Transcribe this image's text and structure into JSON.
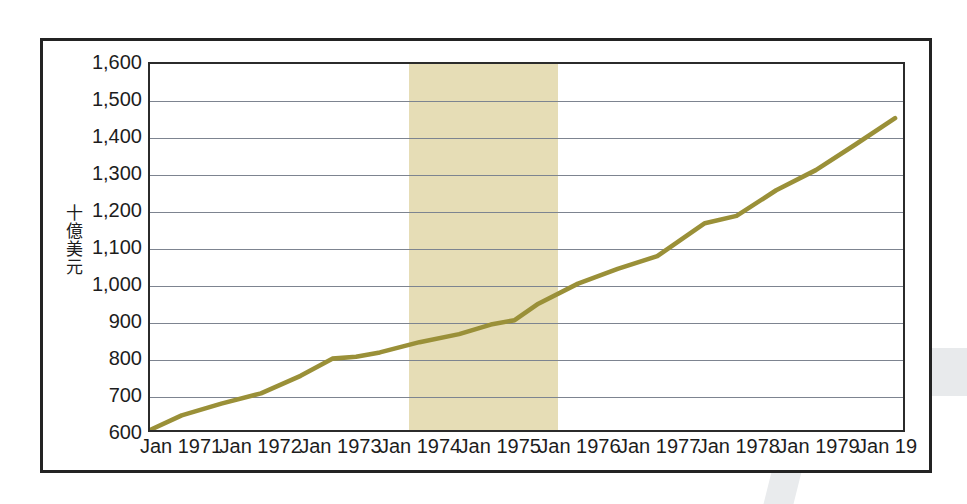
{
  "chart_data": {
    "type": "line",
    "title": "",
    "subtitle": "",
    "xlabel": "",
    "ylabel": "十億美元",
    "ylabel_chars": [
      "十",
      "億",
      "美",
      "元"
    ],
    "ylim": [
      600,
      1600
    ],
    "ytick_step": 100,
    "ytick_labels": [
      "1,600",
      "1,500",
      "1,400",
      "1,300",
      "1,200",
      "1,100",
      "1,000",
      "900",
      "800",
      "700",
      "600"
    ],
    "ytick_values": [
      1600,
      1500,
      1400,
      1300,
      1200,
      1100,
      1000,
      900,
      800,
      700,
      600
    ],
    "xtick_labels": [
      "Jan 1971",
      "Jan 1972",
      "Jan 1973",
      "Jan 1974",
      "Jan 1975",
      "Jan 1976",
      "Jan 1977",
      "Jan 1978",
      "Jan 1979",
      "Jan 19"
    ],
    "xtick_values": [
      1971,
      1972,
      1973,
      1974,
      1975,
      1976,
      1977,
      1978,
      1979,
      1980
    ],
    "xlim": [
      1970.6,
      1980.1
    ],
    "grid": true,
    "legend": "none",
    "series": [
      {
        "name": "十億美元",
        "color": "#9a9038",
        "x": [
          1970.62,
          1971.0,
          1971.5,
          1972.0,
          1972.5,
          1972.9,
          1973.2,
          1973.5,
          1974.0,
          1974.5,
          1974.9,
          1975.2,
          1975.5,
          1976.0,
          1976.5,
          1977.0,
          1977.3,
          1977.6,
          1978.0,
          1978.5,
          1979.0,
          1979.5,
          1980.0
        ],
        "y": [
          602,
          640,
          672,
          700,
          748,
          795,
          800,
          812,
          840,
          862,
          888,
          900,
          945,
          1000,
          1040,
          1075,
          1120,
          1165,
          1185,
          1255,
          1310,
          1380,
          1452
        ]
      }
    ],
    "shaded_regions": [
      {
        "name": "recession-band",
        "x_start": 1973.85,
        "x_end": 1975.72,
        "color": "#e6ddb6"
      }
    ],
    "colors": {
      "line": "#9a9038",
      "gridline": "#7d8490",
      "axis": "#2b2b2b",
      "frame": "#232323",
      "shaded_band": "#e6ddb6",
      "background": "#ffffff",
      "text": "#1d1d1d"
    }
  }
}
